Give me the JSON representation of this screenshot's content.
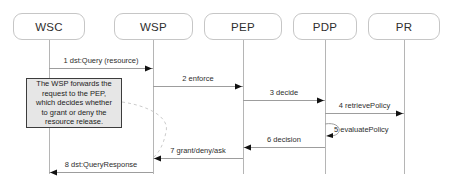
{
  "diagram": {
    "type": "sequence-diagram",
    "colors": {
      "background": "#ffffff",
      "actor_fill": "#ffffff",
      "actor_border": "#c6c6c6",
      "lifeline": "#b5b5b5",
      "message_line": "#9d9d9d",
      "arrowhead": "#111111",
      "text": "#2e2e2e",
      "note_fill": "#e6e6e6",
      "note_border": "#3c3c3c",
      "note_anchor": "#cccccc"
    },
    "actor_box": {
      "top": 13,
      "height": 27
    },
    "lifeline": {
      "top": 40,
      "bottom": 174
    },
    "actors": [
      {
        "label": "WSC",
        "x": 49,
        "box_left": 13,
        "box_width": 72
      },
      {
        "label": "WSP",
        "x": 153,
        "box_left": 114,
        "box_width": 79
      },
      {
        "label": "PEP",
        "x": 243,
        "box_left": 204,
        "box_width": 78
      },
      {
        "label": "PDP",
        "x": 325,
        "box_left": 293,
        "box_width": 64
      },
      {
        "label": "PR",
        "x": 404,
        "box_left": 368,
        "box_width": 72
      }
    ],
    "messages": [
      {
        "num": 1,
        "label": "1 dst:Query (resource)",
        "from": 49,
        "to": 153,
        "y": 68
      },
      {
        "num": 2,
        "label": "2 enforce",
        "from": 153,
        "to": 243,
        "y": 86
      },
      {
        "num": 3,
        "label": "3 decide",
        "from": 243,
        "to": 325,
        "y": 100
      },
      {
        "num": 4,
        "label": "4 retrievePolicy",
        "from": 325,
        "to": 404,
        "y": 113
      },
      {
        "num": 5,
        "label": "5 evaluatePolicy",
        "from": 325,
        "to": 325,
        "y": 124,
        "y2": 136,
        "self": true
      },
      {
        "num": 6,
        "label": "6 decision",
        "from": 325,
        "to": 243,
        "y": 147
      },
      {
        "num": 7,
        "label": "7 grant/deny/ask",
        "from": 243,
        "to": 153,
        "y": 158
      },
      {
        "num": 8,
        "label": "8 dst:QueryResponse",
        "from": 153,
        "to": 49,
        "y": 172
      }
    ],
    "note": {
      "lines": [
        "The WSP forwards the",
        "request to the PEP,",
        "which decides whether",
        "to grant or deny the",
        "resource release."
      ],
      "left": 26,
      "top": 78,
      "width": 96,
      "height": 50,
      "anchor": {
        "from_x": 122,
        "from_y": 102,
        "to_x": 154,
        "to_y": 157
      }
    }
  }
}
